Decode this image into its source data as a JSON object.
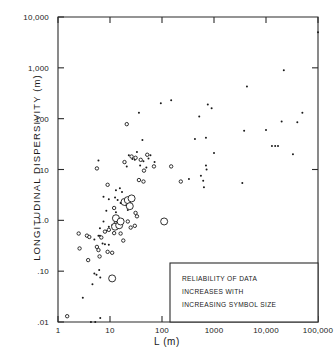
{
  "figure": {
    "background": "#ffffff",
    "ink_color": "#1a1a1a"
  },
  "axes": {
    "x_title": "L (m)",
    "y_title": "LONGITUDINAL   DISPERSIVITY   (m)",
    "x_ticks": [
      "1",
      "10",
      "100",
      "1000",
      "10,000",
      "100,000"
    ],
    "y_ticks": [
      "10,000",
      "1,000",
      "100",
      "10",
      "1.0",
      ".10",
      ".01"
    ]
  },
  "legend": {
    "lines": [
      "RELIABILITY OF DATA",
      "INCREASES WITH",
      "INCREASING SYMBOL SIZE"
    ]
  },
  "chart_data": {
    "type": "scatter",
    "title": "",
    "xlabel": "L (m)",
    "ylabel": "LONGITUDINAL DISPERSIVITY (m)",
    "xscale": "log",
    "yscale": "log",
    "xlim": [
      1,
      100000
    ],
    "ylim": [
      0.01,
      10000
    ],
    "grid": false,
    "legend_position": "bottom-right",
    "annotation": "RELIABILITY OF DATA INCREASES WITH INCREASING SYMBOL SIZE",
    "symbol_note": "Symbol size encodes data reliability; open circles and filled dots are two symbol families, larger = more reliable",
    "series": [
      {
        "name": "small filled dot (low reliability)",
        "marker": "filled-circle",
        "size_px": 2.0,
        "points": [
          [
            3.0,
            0.03
          ],
          [
            4.3,
            0.01
          ],
          [
            5.2,
            0.01
          ],
          [
            6.5,
            0.012
          ],
          [
            4.6,
            0.055
          ],
          [
            5.0,
            0.09
          ],
          [
            5.5,
            0.085
          ],
          [
            6.2,
            0.105
          ],
          [
            6.5,
            0.075
          ],
          [
            5.0,
            0.42
          ],
          [
            6.0,
            0.5
          ],
          [
            6.4,
            0.5
          ],
          [
            7.2,
            0.35
          ],
          [
            8.0,
            0.34
          ],
          [
            9.5,
            0.33
          ],
          [
            6.4,
            0.7
          ],
          [
            8.5,
            0.62
          ],
          [
            9.5,
            0.75
          ],
          [
            7.5,
            0.95
          ],
          [
            11.0,
            0.8
          ],
          [
            8.5,
            1.55
          ],
          [
            13.0,
            1.45
          ],
          [
            7.5,
            2.9
          ],
          [
            9.5,
            2.6
          ],
          [
            12.5,
            2.8
          ],
          [
            14.0,
            2.5
          ],
          [
            16.0,
            2.2
          ],
          [
            18.0,
            2.3
          ],
          [
            20.0,
            2.0
          ],
          [
            24.0,
            1.9
          ],
          [
            22.0,
            1.6
          ],
          [
            26.0,
            1.75
          ],
          [
            13.0,
            3.9
          ],
          [
            15.5,
            4.3
          ],
          [
            17.0,
            3.6
          ],
          [
            6.0,
            15.0
          ],
          [
            19.5,
            13.5
          ],
          [
            21.0,
            11.5
          ],
          [
            23.0,
            19.0
          ],
          [
            27.0,
            16.0
          ],
          [
            30.0,
            15.5
          ],
          [
            33.0,
            22.0
          ],
          [
            38.0,
            12.0
          ],
          [
            44.0,
            14.5
          ],
          [
            50.0,
            11.0
          ],
          [
            55.0,
            16.5
          ],
          [
            60.0,
            19.0
          ],
          [
            72.0,
            14.0
          ],
          [
            42.0,
            38.0
          ],
          [
            36.0,
            130.0
          ],
          [
            95.0,
            200.0
          ],
          [
            150.0,
            230.0
          ],
          [
            230.0,
            5.9
          ],
          [
            330.0,
            6.5
          ],
          [
            430.0,
            40.0
          ],
          [
            520.0,
            110.0
          ],
          [
            560.0,
            7.5
          ],
          [
            620.0,
            6.0
          ],
          [
            640.0,
            4.5
          ],
          [
            700.0,
            42.0
          ],
          [
            760.0,
            190.0
          ],
          [
            700.0,
            12.0
          ],
          [
            720.0,
            10.0
          ],
          [
            900.0,
            160.0
          ],
          [
            1000.0,
            21.0
          ],
          [
            3500.0,
            5.4
          ],
          [
            3800.0,
            58.0
          ],
          [
            4300.0,
            430.0
          ],
          [
            10000.0,
            60.0
          ],
          [
            13000.0,
            29.0
          ],
          [
            15000.0,
            29.0
          ],
          [
            17000.0,
            29.0
          ],
          [
            20000.0,
            88.0
          ],
          [
            22000.0,
            900.0
          ],
          [
            33000.0,
            20.0
          ],
          [
            40000.0,
            85.0
          ],
          [
            50000.0,
            130.0
          ],
          [
            100000.0,
            5000.0
          ]
        ]
      },
      {
        "name": "small open circle (low-medium reliability)",
        "marker": "open-circle",
        "size_px": 3.4,
        "points": [
          [
            1.5,
            0.013
          ],
          [
            2.6,
            0.28
          ],
          [
            2.5,
            0.55
          ],
          [
            3.6,
            0.5
          ],
          [
            4.0,
            0.47
          ],
          [
            3.8,
            0.165
          ],
          [
            5.6,
            0.3
          ],
          [
            6.0,
            0.26
          ],
          [
            6.8,
            0.46
          ],
          [
            6.3,
            0.195
          ],
          [
            9.0,
            0.24
          ],
          [
            11.0,
            0.23
          ],
          [
            8.0,
            0.6
          ],
          [
            9.5,
            0.65
          ],
          [
            12.0,
            0.56
          ],
          [
            16.0,
            0.55
          ],
          [
            18.0,
            0.4
          ],
          [
            13.0,
            0.92
          ],
          [
            17.0,
            0.98
          ],
          [
            22.0,
            0.95
          ],
          [
            25.0,
            0.72
          ],
          [
            30.0,
            0.78
          ],
          [
            12.0,
            1.75
          ],
          [
            31.0,
            1.4
          ],
          [
            33.0,
            1.2
          ],
          [
            9.0,
            5.0
          ],
          [
            36.0,
            6.2
          ],
          [
            44.0,
            5.8
          ],
          [
            19.0,
            14.0
          ],
          [
            26.0,
            18.0
          ],
          [
            31.0,
            17.0
          ],
          [
            39.0,
            15.5
          ],
          [
            52.0,
            19.5
          ],
          [
            70.0,
            11.5
          ],
          [
            5.6,
            10.5
          ],
          [
            21.0,
            78.0
          ],
          [
            230.0,
            5.8
          ],
          [
            150.0,
            11.5
          ],
          [
            45.0,
            9.5
          ]
        ]
      },
      {
        "name": "large open circle (high reliability)",
        "marker": "open-circle",
        "size_px": 7.0,
        "points": [
          [
            11.0,
            0.072
          ],
          [
            12.5,
            0.75
          ],
          [
            15.0,
            0.8
          ],
          [
            13.0,
            1.1
          ],
          [
            16.0,
            0.95
          ],
          [
            19.0,
            2.3
          ],
          [
            22.0,
            2.5
          ],
          [
            26.0,
            2.7
          ],
          [
            24.0,
            1.9
          ],
          [
            110.0,
            0.95
          ]
        ]
      }
    ]
  }
}
